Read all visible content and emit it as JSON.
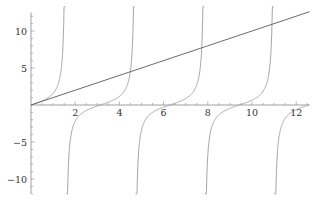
{
  "chart_data": {
    "type": "line",
    "title": "",
    "xlabel": "",
    "ylabel": "",
    "xlim": [
      0,
      12.6
    ],
    "ylim": [
      -12,
      12.5
    ],
    "grid": false,
    "legend": null,
    "x_ticks": [
      2,
      4,
      6,
      8,
      10,
      12
    ],
    "y_ticks": [
      -10,
      -5,
      5,
      10
    ],
    "x_tick_labels": [
      "2",
      "4",
      "6",
      "8",
      "10",
      "12"
    ],
    "y_tick_labels": [
      "-10",
      "-5",
      "5",
      "10"
    ],
    "series": [
      {
        "name": "y = x",
        "function": "x",
        "color": "#5a5a5a",
        "x": [
          0,
          2,
          4,
          6,
          8,
          10,
          12,
          12.6
        ],
        "y": [
          0,
          2,
          4,
          6,
          8,
          10,
          12,
          12.6
        ]
      },
      {
        "name": "y = tan(x)",
        "function": "tan(x)",
        "color": "#9a9a9a",
        "asymptotes": [
          1.5708,
          4.7124,
          7.854,
          10.9956
        ],
        "x": [
          0,
          0.5,
          1.0,
          1.4,
          2.0,
          2.5,
          3.0,
          3.1416,
          3.5,
          4.0,
          4.5,
          5.0,
          5.5,
          6.0,
          6.2832,
          7.0,
          7.5,
          8.5,
          9.0,
          9.4248,
          10.0,
          10.5,
          11.5,
          12.0,
          12.5
        ],
        "y": [
          0,
          0.55,
          1.56,
          5.8,
          -2.19,
          -0.75,
          -0.14,
          0,
          0.37,
          1.16,
          4.64,
          -3.38,
          -0.99,
          -0.29,
          0,
          0.87,
          2.71,
          -1.56,
          -0.45,
          0,
          0.65,
          1.65,
          -0.89,
          -0.64,
          -0.07
        ]
      }
    ]
  },
  "layout": {
    "origin_px": [
      31,
      105
    ],
    "px_per_x": 22.1,
    "px_per_y": 7.4,
    "axis_color": "#888888"
  }
}
